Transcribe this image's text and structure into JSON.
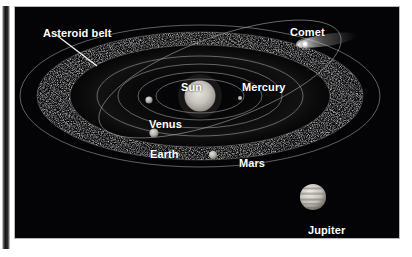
{
  "figure": {
    "kind": "solar-system-diagram",
    "background_color": "#040406",
    "label_color": "#ffffff",
    "orbit_color": "#b0aea6",
    "labels": {
      "asteroid_belt": "Asteroid belt",
      "comet": "Comet",
      "sun": "Sun",
      "mercury": "Mercury",
      "venus": "Venus",
      "earth": "Earth",
      "mars": "Mars",
      "jupiter": "Jupiter"
    },
    "bodies": [
      {
        "name": "Sun",
        "cx": 185,
        "cy": 89,
        "r": 15.5,
        "color": "#c9c7bf"
      },
      {
        "name": "Mercury",
        "cx": 225,
        "cy": 91,
        "r": 2.0,
        "color": "#b8b6ae"
      },
      {
        "name": "Venus",
        "cx": 134,
        "cy": 93,
        "r": 3.6,
        "color": "#b8b6ae"
      },
      {
        "name": "Earth",
        "cx": 139,
        "cy": 126,
        "r": 4.6,
        "color": "#bdbbb3"
      },
      {
        "name": "Mars",
        "cx": 198,
        "cy": 148,
        "r": 4.2,
        "color": "#b2b0a8"
      },
      {
        "name": "Jupiter",
        "cx": 298,
        "cy": 190,
        "r": 13.0,
        "color": "#cfcdc5"
      },
      {
        "name": "Comet",
        "cx": 290,
        "cy": 37,
        "r": 3.6,
        "color": "#ffffff"
      }
    ],
    "orbits": [
      {
        "name": "mercury-orbit",
        "rx": 44,
        "ry": 17
      },
      {
        "name": "venus-orbit",
        "rx": 62,
        "ry": 24
      },
      {
        "name": "earth-orbit",
        "rx": 82,
        "ry": 32
      },
      {
        "name": "mars-orbit",
        "rx": 103,
        "ry": 40
      },
      {
        "name": "belt-inner",
        "rx": 130,
        "ry": 51
      },
      {
        "name": "belt-outer",
        "rx": 163,
        "ry": 64
      },
      {
        "name": "jupiter-orbit",
        "rx": 180,
        "ry": 71
      }
    ],
    "comet_orbit": {
      "name": "comet-orbit",
      "rx": 128,
      "ry": 42,
      "rotation": -20
    },
    "leader_line": {
      "x1": 55,
      "y1": 34,
      "x2": 97,
      "y2": 66
    }
  }
}
